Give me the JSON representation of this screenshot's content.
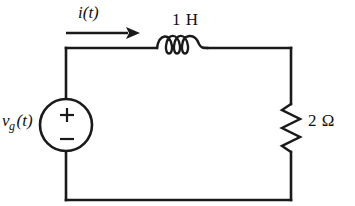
{
  "figure": {
    "background_color": "#ffffff",
    "line_color": "#1a1a1a"
  },
  "labels": {
    "current": "i(t)",
    "inductor": "1 H",
    "resistor": "2 Ω",
    "source_symbol": "v",
    "source_subscript": "g",
    "source_arg": "(t)",
    "polarity_plus": "+",
    "polarity_minus": "−"
  },
  "components": [
    {
      "name": "voltage-source",
      "type": "independent-voltage-source",
      "label": "v_g(t)",
      "value": "v_g(t)",
      "polarity_top": "+",
      "polarity_bottom": "−",
      "position": "left-branch"
    },
    {
      "name": "inductor",
      "type": "inductor",
      "label": "1 H",
      "value": 1,
      "unit": "H",
      "coils": 3,
      "position": "top-branch"
    },
    {
      "name": "resistor",
      "type": "resistor",
      "label": "2 Ω",
      "value": 2,
      "unit": "Ω",
      "position": "right-branch"
    }
  ],
  "annotations": [
    {
      "name": "current-arrow",
      "label": "i(t)",
      "direction": "right",
      "description": "mesh current reference direction in the top branch"
    }
  ]
}
